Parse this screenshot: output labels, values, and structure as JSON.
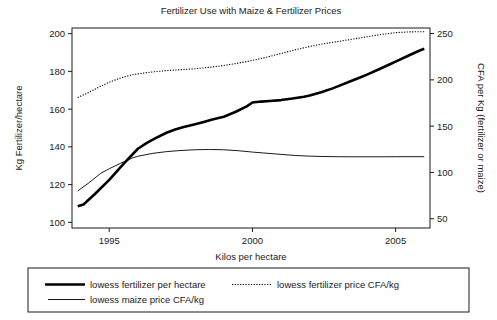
{
  "chart_data": {
    "type": "line",
    "title": "Fertilizer Use with Maize & Fertilizer Prices",
    "xlabel": "Kilos per hectare",
    "ylabel": "Kg Fertilizer/hectare",
    "y2label": "CFA per Kg (fertilizer or maize)",
    "xlim": [
      1993.7,
      2006.2
    ],
    "ylim": [
      97,
      203
    ],
    "y2lim": [
      40,
      256
    ],
    "grid": false,
    "legend_position": "below-plot-boxed",
    "xticks": [
      1995,
      2000,
      2005
    ],
    "xtick_labels": [
      "1995",
      "2000",
      "2005"
    ],
    "yticks": [
      100,
      120,
      140,
      160,
      180,
      200
    ],
    "ytick_labels": [
      "100",
      "120",
      "140",
      "160",
      "180",
      "200"
    ],
    "y2ticks": [
      50,
      100,
      150,
      200,
      250
    ],
    "y2tick_labels": [
      "50",
      "100",
      "150",
      "200",
      "250"
    ],
    "series": [
      {
        "name": "lowess fertilizer per hectare",
        "style": "thick-solid",
        "axis": "left",
        "units": "Kg Fertilizer/hectare",
        "x": [
          1993.9,
          1994.1,
          1994.5,
          1995.0,
          1995.5,
          1996.0,
          1996.3,
          1996.6,
          1997.0,
          1997.3,
          1997.6,
          1998.0,
          1998.3,
          1998.6,
          1999.0,
          1999.4,
          1999.8,
          2000.0,
          2000.3,
          2000.6,
          2001.0,
          2001.4,
          2001.8,
          2002.0,
          2002.4,
          2002.8,
          2003.0,
          2003.4,
          2003.8,
          2004.0,
          2004.4,
          2004.8,
          2005.0,
          2005.4,
          2005.8,
          2006.0
        ],
        "y": [
          108.5,
          109.5,
          115.0,
          122.5,
          131.0,
          139.0,
          142.0,
          144.5,
          147.5,
          149.2,
          150.5,
          152.0,
          153.2,
          154.5,
          156.0,
          158.5,
          161.5,
          163.5,
          164.0,
          164.3,
          164.8,
          165.6,
          166.6,
          167.2,
          169.0,
          171.0,
          172.2,
          174.6,
          177.0,
          178.3,
          181.0,
          183.8,
          185.2,
          188.0,
          190.8,
          192.0
        ]
      },
      {
        "name": "lowess fertilizer price CFA/kg",
        "style": "dotted",
        "axis": "right",
        "units": "CFA per Kg",
        "x": [
          1993.9,
          1994.2,
          1994.6,
          1995.0,
          1995.4,
          1995.8,
          1996.0,
          1996.5,
          1997.0,
          1997.5,
          1998.0,
          1998.5,
          1999.0,
          1999.5,
          2000.0,
          2000.5,
          2001.0,
          2001.5,
          2002.0,
          2002.5,
          2003.0,
          2003.5,
          2004.0,
          2004.5,
          2005.0,
          2005.5,
          2006.0
        ],
        "y": [
          181.0,
          185.0,
          191.5,
          197.5,
          202.0,
          205.5,
          206.5,
          208.5,
          210.0,
          211.0,
          212.0,
          213.5,
          215.5,
          218.0,
          221.0,
          224.5,
          228.5,
          232.5,
          236.0,
          239.0,
          241.5,
          244.0,
          246.5,
          249.0,
          251.0,
          251.8,
          252.0
        ]
      },
      {
        "name": "lowess maize price CFA/kg",
        "style": "thin-solid",
        "axis": "right",
        "units": "CFA per Kg",
        "x": [
          1993.9,
          1994.3,
          1994.7,
          1995.0,
          1995.4,
          1995.8,
          1996.0,
          1996.5,
          1997.0,
          1997.4,
          1997.8,
          1998.0,
          1998.5,
          1999.0,
          1999.5,
          2000.0,
          2000.4,
          2000.8,
          2001.0,
          2001.5,
          2002.0,
          2002.5,
          2003.0,
          2003.5,
          2004.0,
          2004.5,
          2005.0,
          2005.5,
          2006.0
        ],
        "y": [
          80.0,
          89.0,
          99.0,
          104.0,
          110.0,
          115.5,
          117.5,
          120.5,
          122.5,
          123.5,
          124.2,
          124.5,
          124.8,
          124.5,
          123.5,
          122.0,
          121.0,
          120.0,
          119.5,
          118.3,
          117.6,
          117.2,
          117.0,
          116.9,
          116.9,
          116.9,
          117.0,
          117.0,
          117.0
        ]
      }
    ],
    "legend": [
      {
        "label": "lowess fertilizer per hectare",
        "style": "thick-solid"
      },
      {
        "label": "lowess fertilizer price CFA/kg",
        "style": "dotted"
      },
      {
        "label": "lowess maize price CFA/kg",
        "style": "thin-solid"
      }
    ]
  }
}
